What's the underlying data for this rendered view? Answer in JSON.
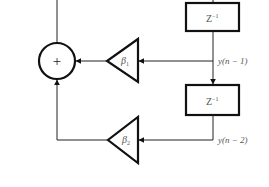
{
  "diagram": {
    "type": "block-diagram",
    "adder": {
      "symbol": "+"
    },
    "delays": [
      {
        "id": "delay1",
        "label": "Z",
        "exponent": "−1"
      },
      {
        "id": "delay2",
        "label": "Z",
        "exponent": "−1"
      }
    ],
    "gains": [
      {
        "id": "beta1",
        "symbol": "β",
        "subscript": "1"
      },
      {
        "id": "beta2",
        "symbol": "β",
        "subscript": "2"
      }
    ],
    "signals": [
      {
        "id": "y_n_minus_1",
        "label": "y(n − 1)"
      },
      {
        "id": "y_n_minus_2",
        "label": "y(n − 2)"
      }
    ]
  },
  "colors": {
    "line": "#222222",
    "text": "#555555",
    "background": "#ffffff"
  }
}
